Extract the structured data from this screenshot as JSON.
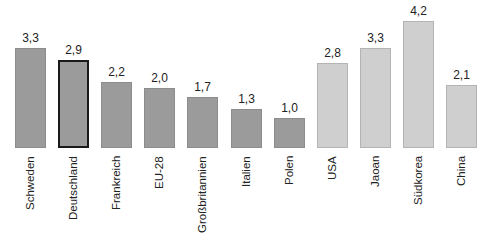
{
  "chart_data": {
    "type": "bar",
    "title": "",
    "xlabel": "",
    "ylabel": "",
    "ylim": [
      0,
      4.2
    ],
    "grid": false,
    "legend": null,
    "categories": [
      "Schweden",
      "Deutschland",
      "Frankreich",
      "EU-28",
      "Großbritannien",
      "Italien",
      "Polen",
      "USA",
      "Jaoan",
      "Südkorea",
      "China"
    ],
    "values": [
      3.3,
      2.9,
      2.2,
      2.0,
      1.7,
      1.3,
      1.0,
      2.8,
      3.3,
      4.2,
      2.1
    ],
    "value_labels": [
      "3,3",
      "2,9",
      "2,2",
      "2,0",
      "1,7",
      "1,3",
      "1,0",
      "2,8",
      "3,3",
      "4,2",
      "2,1"
    ],
    "groups": [
      "eu",
      "eu",
      "eu",
      "eu",
      "eu",
      "eu",
      "eu",
      "other",
      "other",
      "other",
      "other"
    ],
    "highlighted": "Deutschland"
  },
  "colors": {
    "eu_bar": "#9b9b9b",
    "other_bar": "#cfcfcf",
    "highlight_border": "#1a1a1a",
    "text": "#222222"
  }
}
